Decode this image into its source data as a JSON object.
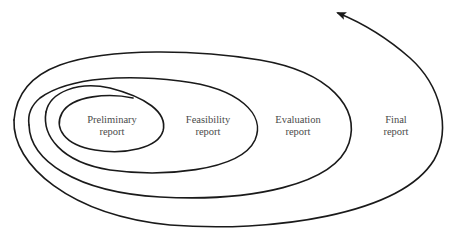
{
  "diagram": {
    "type": "spiral",
    "stroke_color": "#1a1a1a",
    "text_color": "#4a4a4a",
    "direction": "outward spiral ending in arrow pointing up-left",
    "stages": [
      {
        "line1": "Preliminary",
        "line2": "report"
      },
      {
        "line1": "Feasibility",
        "line2": "report"
      },
      {
        "line1": "Evaluation",
        "line2": "report"
      },
      {
        "line1": "Final",
        "line2": "report"
      }
    ]
  }
}
